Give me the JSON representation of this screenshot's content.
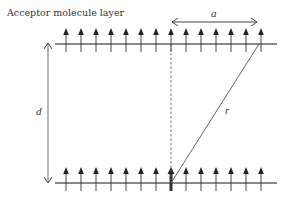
{
  "title": "Acceptor molecule layer",
  "labels": {
    "a": "a",
    "d": "d",
    "r": "r"
  },
  "colors": {
    "layer_line": "#8a8a8a",
    "arrow": "#333333",
    "text": "#333333",
    "background": "#ffffff"
  },
  "layers": {
    "top_y": 44,
    "bottom_y": 183,
    "x_start": 55,
    "x_end": 277,
    "arrow_x": [
      66,
      81,
      96,
      111,
      126,
      141,
      156,
      171,
      186,
      201,
      216,
      231,
      246,
      261
    ]
  },
  "highlighted_arrow_x": 171,
  "diagonal": {
    "x1": 171,
    "y1": 183,
    "x2": 259,
    "y2": 44
  }
}
